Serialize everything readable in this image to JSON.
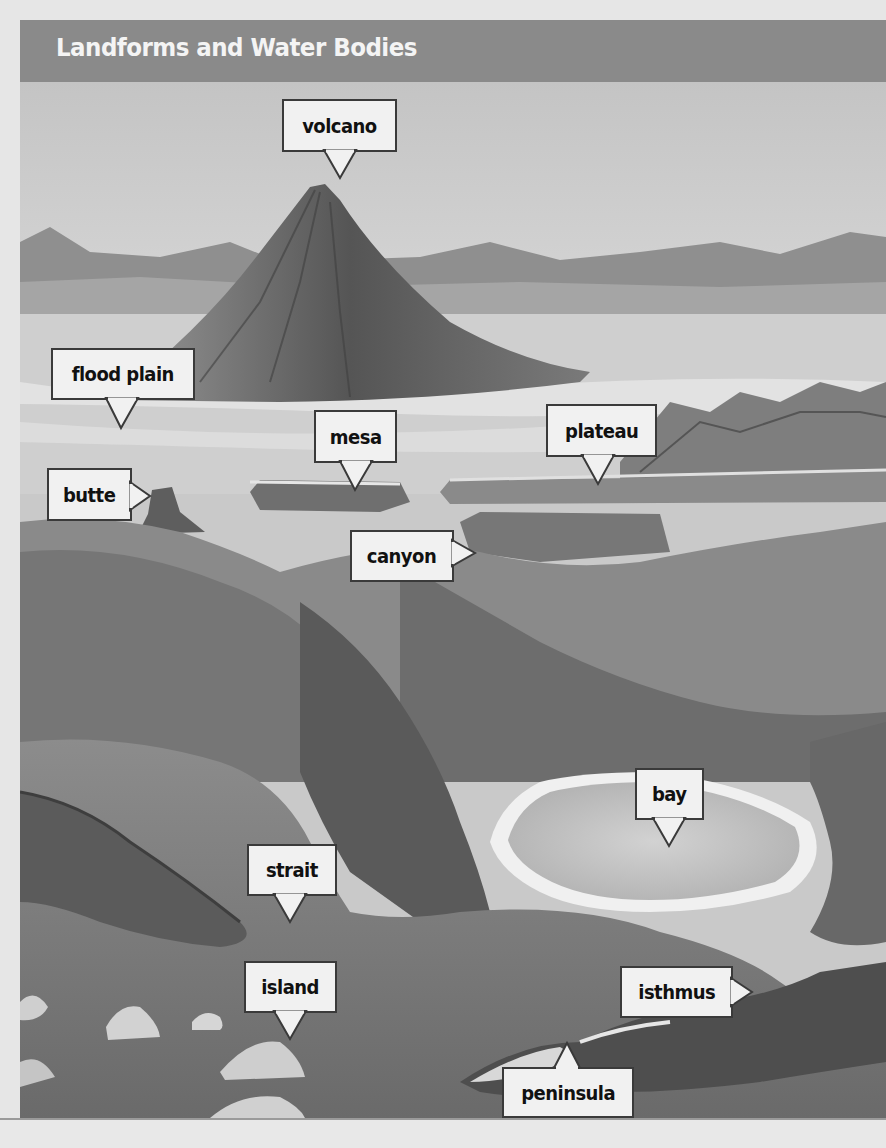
{
  "title": "Landforms and Water Bodies",
  "labels": {
    "volcano": "volcano",
    "flood_plain": "flood plain",
    "mesa": "mesa",
    "plateau": "plateau",
    "butte": "butte",
    "canyon": "canyon",
    "bay": "bay",
    "strait": "strait",
    "island": "island",
    "isthmus": "isthmus",
    "peninsula": "peninsula"
  },
  "colors": {
    "title_bar": "#8a8a8a",
    "title_text": "#f4f4f4",
    "label_bg": "#f1f1f1",
    "label_border": "#3a3a3a"
  }
}
